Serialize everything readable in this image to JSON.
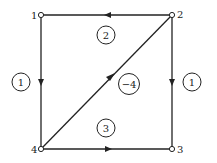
{
  "nodes": [
    {
      "id": "1",
      "label": "1"
    },
    {
      "id": "2",
      "label": "2"
    },
    {
      "id": "3",
      "label": "3"
    },
    {
      "id": "4",
      "label": "4"
    }
  ],
  "edges": [
    {
      "from": "2",
      "to": "1"
    },
    {
      "from": "1",
      "to": "4"
    },
    {
      "from": "2",
      "to": "3"
    },
    {
      "from": "4",
      "to": "3"
    },
    {
      "from": "4",
      "to": "2"
    }
  ],
  "circles": {
    "left": "1",
    "right": "1",
    "top": "2",
    "center": "−4",
    "bottom": "3"
  },
  "colors": {
    "stroke": "#222222",
    "background": "#ffffff"
  }
}
